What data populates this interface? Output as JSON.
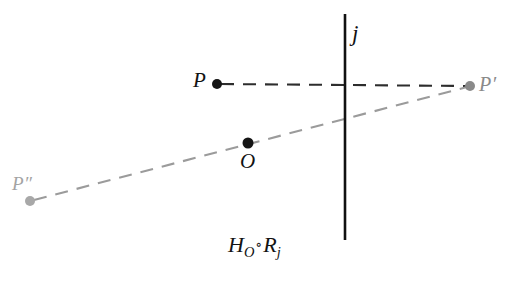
{
  "figure": {
    "kind": "geometry-diagram",
    "width": 528,
    "height": 286,
    "background": "#ffffff",
    "caption": {
      "base1": "H",
      "sub1": "O",
      "operator": "∘",
      "base2": "R",
      "sub2": "j",
      "full_text": "H_O ∘ R_j"
    },
    "labels": {
      "mirror_line": "j",
      "point_p": "P",
      "point_p_prime": "P′",
      "point_p_double_prime": "P″",
      "center_o": "O"
    },
    "points": [
      {
        "name": "P",
        "label": "P",
        "x": 217,
        "y": 84,
        "r": 5.0,
        "color": "#151515"
      },
      {
        "name": "P'",
        "label": "P′",
        "x": 470,
        "y": 86,
        "r": 5.0,
        "color": "#8a8a8a"
      },
      {
        "name": "P''",
        "label": "P″",
        "x": 30,
        "y": 201,
        "r": 5.0,
        "color": "#a8a8a8"
      },
      {
        "name": "O",
        "label": "O",
        "x": 248,
        "y": 143,
        "r": 5.5,
        "color": "#151515"
      }
    ],
    "segments": [
      {
        "name": "segment-p-to-pprime",
        "from": "P",
        "to": "P'",
        "x1": 221,
        "y1": 84,
        "x2": 468,
        "y2": 86,
        "color": "#2d2d2d",
        "width": 2.1,
        "dash": "13 9"
      },
      {
        "name": "segment-pdoubleprime-to-pprime",
        "from": "P''",
        "to": "P'",
        "x1": 34,
        "y1": 200,
        "x2": 467,
        "y2": 87,
        "color": "#9b9b9b",
        "width": 2.1,
        "dash": "13 9"
      }
    ],
    "mirror_line": {
      "name": "line-j",
      "x": 345,
      "y1": 14,
      "y2": 240,
      "color": "#111111",
      "width": 2.6
    },
    "colors": {
      "ink": "#151515",
      "gray_mid": "#8a8a8a",
      "gray_light": "#a8a8a8",
      "dash_dark": "#2d2d2d",
      "dash_gray": "#9b9b9b"
    }
  }
}
